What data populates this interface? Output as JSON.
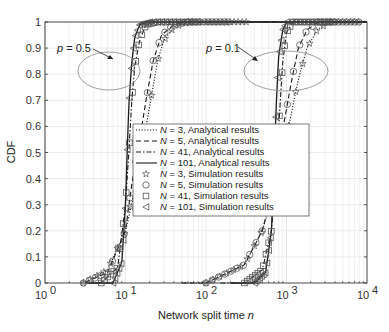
{
  "chart_data": {
    "type": "line",
    "title": "",
    "xlabel": "Network split time",
    "xlabel_italic": "n",
    "ylabel": "CDF",
    "xscale": "log",
    "xlim": [
      1,
      10000
    ],
    "ylim": [
      0,
      1
    ],
    "grid": true,
    "x_ticks": [
      "10",
      "10",
      "10",
      "10",
      "10"
    ],
    "x_tick_exponents": [
      "0",
      "1",
      "2",
      "3",
      "4"
    ],
    "y_ticks": [
      "0",
      "0.1",
      "0.2",
      "0.3",
      "0.4",
      "0.5",
      "0.6",
      "0.7",
      "0.8",
      "0.9",
      "1"
    ],
    "legend_position": "center-inside",
    "legend": [
      {
        "label": "N = 3, Analytical results",
        "style": "dotted"
      },
      {
        "label": "N = 5, Analytical results",
        "style": "dashed"
      },
      {
        "label": "N = 41, Analytical results",
        "style": "dash-dot"
      },
      {
        "label": "N = 101, Analytical results",
        "style": "solid"
      },
      {
        "label": "N = 3, Simulation results",
        "marker": "star"
      },
      {
        "label": "N = 5, Simulation results",
        "marker": "circle"
      },
      {
        "label": "N = 41, Simulation results",
        "marker": "square"
      },
      {
        "label": "N = 101, Simulation results",
        "marker": "triangle-left"
      }
    ],
    "annotations": [
      {
        "text": "p = 0.5",
        "target": "ellipse around n≈10–30, CDF≈0.75–0.9"
      },
      {
        "text": "p = 0.1",
        "target": "ellipse around n≈700–2500, CDF≈0.75–0.9"
      }
    ],
    "series": [
      {
        "name": "p=0.5, N=3",
        "x": [
          3,
          6,
          10,
          13,
          16,
          20,
          25,
          30,
          40,
          60,
          100
        ],
        "y": [
          0,
          0.05,
          0.2,
          0.35,
          0.5,
          0.68,
          0.85,
          0.93,
          0.98,
          1.0,
          1.0
        ]
      },
      {
        "name": "p=0.5, N=5",
        "x": [
          3,
          6,
          10,
          12,
          15,
          18,
          22,
          28,
          40,
          60
        ],
        "y": [
          0,
          0.04,
          0.2,
          0.38,
          0.55,
          0.7,
          0.85,
          0.95,
          0.99,
          1.0
        ]
      },
      {
        "name": "p=0.5, N=41",
        "x": [
          5,
          8,
          10,
          11,
          12,
          13,
          15,
          18,
          25
        ],
        "y": [
          0,
          0.06,
          0.3,
          0.5,
          0.7,
          0.83,
          0.93,
          0.99,
          1.0
        ]
      },
      {
        "name": "p=0.5, N=101",
        "x": [
          7,
          9,
          10,
          10.5,
          11,
          12,
          13,
          15,
          20
        ],
        "y": [
          0,
          0.08,
          0.3,
          0.5,
          0.68,
          0.85,
          0.94,
          0.99,
          1.0
        ]
      },
      {
        "name": "p=0.1, N=3",
        "x": [
          100,
          300,
          500,
          700,
          900,
          1100,
          1400,
          1800,
          2400,
          3500
        ],
        "y": [
          0,
          0.07,
          0.2,
          0.35,
          0.5,
          0.62,
          0.78,
          0.9,
          0.97,
          1.0
        ]
      },
      {
        "name": "p=0.1, N=5",
        "x": [
          100,
          300,
          500,
          650,
          800,
          950,
          1150,
          1400,
          1800,
          2500
        ],
        "y": [
          0,
          0.07,
          0.2,
          0.34,
          0.5,
          0.63,
          0.77,
          0.9,
          0.97,
          1.0
        ]
      },
      {
        "name": "p=0.1, N=41",
        "x": [
          300,
          500,
          650,
          750,
          820,
          900,
          1000,
          1200
        ],
        "y": [
          0,
          0.05,
          0.2,
          0.45,
          0.65,
          0.85,
          0.96,
          1.0
        ]
      },
      {
        "name": "p=0.1, N=101",
        "x": [
          400,
          550,
          650,
          700,
          750,
          800,
          900,
          1000
        ],
        "y": [
          0,
          0.04,
          0.2,
          0.45,
          0.7,
          0.87,
          0.97,
          1.0
        ]
      }
    ]
  }
}
